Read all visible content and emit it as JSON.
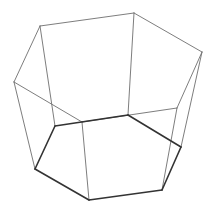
{
  "diagram": {
    "type": "wireframe",
    "shape": "hexagonal frustum",
    "background": "#ffffff",
    "colors": {
      "thin_edge": "#6e6e6e",
      "thick_edge": "#333333"
    },
    "top_face": [
      [
        40,
        26
      ],
      [
        134,
        13
      ],
      [
        202,
        52
      ],
      [
        177,
        108
      ],
      [
        82,
        122
      ],
      [
        14,
        82
      ]
    ],
    "bottom_face": [
      [
        55,
        126
      ],
      [
        128,
        115
      ],
      [
        181,
        147
      ],
      [
        162,
        190
      ],
      [
        89,
        200
      ],
      [
        35,
        169
      ]
    ],
    "lateral_edges": [
      [
        [
          40,
          26
        ],
        [
          55,
          126
        ]
      ],
      [
        [
          134,
          13
        ],
        [
          128,
          115
        ]
      ],
      [
        [
          202,
          52
        ],
        [
          181,
          147
        ]
      ],
      [
        [
          177,
          108
        ],
        [
          162,
          190
        ]
      ],
      [
        [
          82,
          122
        ],
        [
          89,
          200
        ]
      ],
      [
        [
          14,
          82
        ],
        [
          35,
          169
        ]
      ]
    ]
  }
}
